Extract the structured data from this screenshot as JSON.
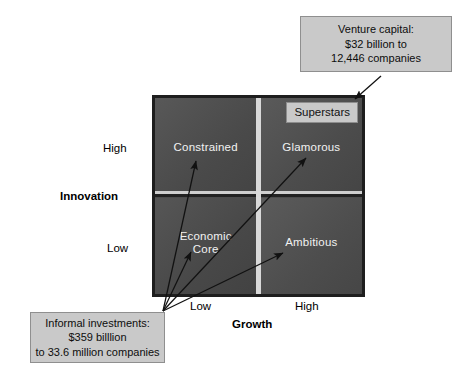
{
  "diagram": {
    "matrix": {
      "quadrants": [
        {
          "key": "constrained",
          "label": "Constrained",
          "growth": "Low",
          "innovation": "High"
        },
        {
          "key": "glamorous",
          "label": "Glamorous",
          "growth": "High",
          "innovation": "High"
        },
        {
          "key": "economic_core",
          "label": "Economic\nCore",
          "growth": "Low",
          "innovation": "Low"
        },
        {
          "key": "ambitious",
          "label": "Ambitious",
          "growth": "High",
          "innovation": "Low"
        }
      ],
      "inset_label": "Superstars"
    },
    "axes": {
      "y": {
        "title": "Innovation",
        "high": "High",
        "low": "Low"
      },
      "x": {
        "title": "Growth",
        "low": "Low",
        "high": "High"
      }
    },
    "callouts": [
      {
        "key": "venture_capital",
        "text": "Venture capital:\n$32 billion to\n12,446 companies",
        "amount": "$32 billion",
        "companies": "12,446 companies"
      },
      {
        "key": "informal_investments",
        "text": "Informal investments:\n$359 billlion\nto 33.6 million companies",
        "amount": "$359 billlion",
        "companies": "33.6 million companies"
      }
    ],
    "colors": {
      "quadrant_fill": "#4d4d4d",
      "matrix_border": "#1e1e1e",
      "divider": "#d9d9d9",
      "callout_fill": "#c9c9c9",
      "callout_border": "#8f8f8f",
      "quadrant_text": "#f2f2f2",
      "body_text": "#000000",
      "arrow": "#111111",
      "background": "#ffffff"
    }
  }
}
